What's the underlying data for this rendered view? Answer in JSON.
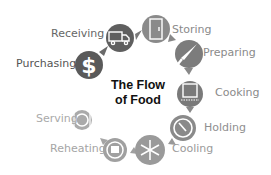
{
  "title_line1": "The Flow",
  "title_line2": "of Food",
  "steps": [
    {
      "label": "Purchasing",
      "icon": "dollar-icon",
      "color": "#5a5a5a",
      "label_color": "#555555"
    },
    {
      "label": "Receiving",
      "icon": "truck-icon",
      "color": "#5f5f5f",
      "label_color": "#666666"
    },
    {
      "label": "Storing",
      "icon": "refrigerator-icon",
      "color": "#8a8a8a",
      "label_color": "#8a8a8a"
    },
    {
      "label": "Preparing",
      "icon": "knife-icon",
      "color": "#7c7c7c",
      "label_color": "#8a8a8a"
    },
    {
      "label": "Cooking",
      "icon": "pot-icon",
      "color": "#7a7a7a",
      "label_color": "#8a8a8a"
    },
    {
      "label": "Holding",
      "icon": "thermometer-gauge-icon",
      "color": "#8a8a8a",
      "label_color": "#8f8f8f"
    },
    {
      "label": "Cooling",
      "icon": "snowflake-icon",
      "color": "#9a9a9a",
      "label_color": "#9a9a9a"
    },
    {
      "label": "Reheating",
      "icon": "reheat-cycle-icon",
      "color": "#a0a0a0",
      "label_color": "#a5a5a5"
    },
    {
      "label": "Serving",
      "icon": "plate-icon",
      "color": "#aaaaaa",
      "label_color": "#aaaaaa"
    }
  ]
}
